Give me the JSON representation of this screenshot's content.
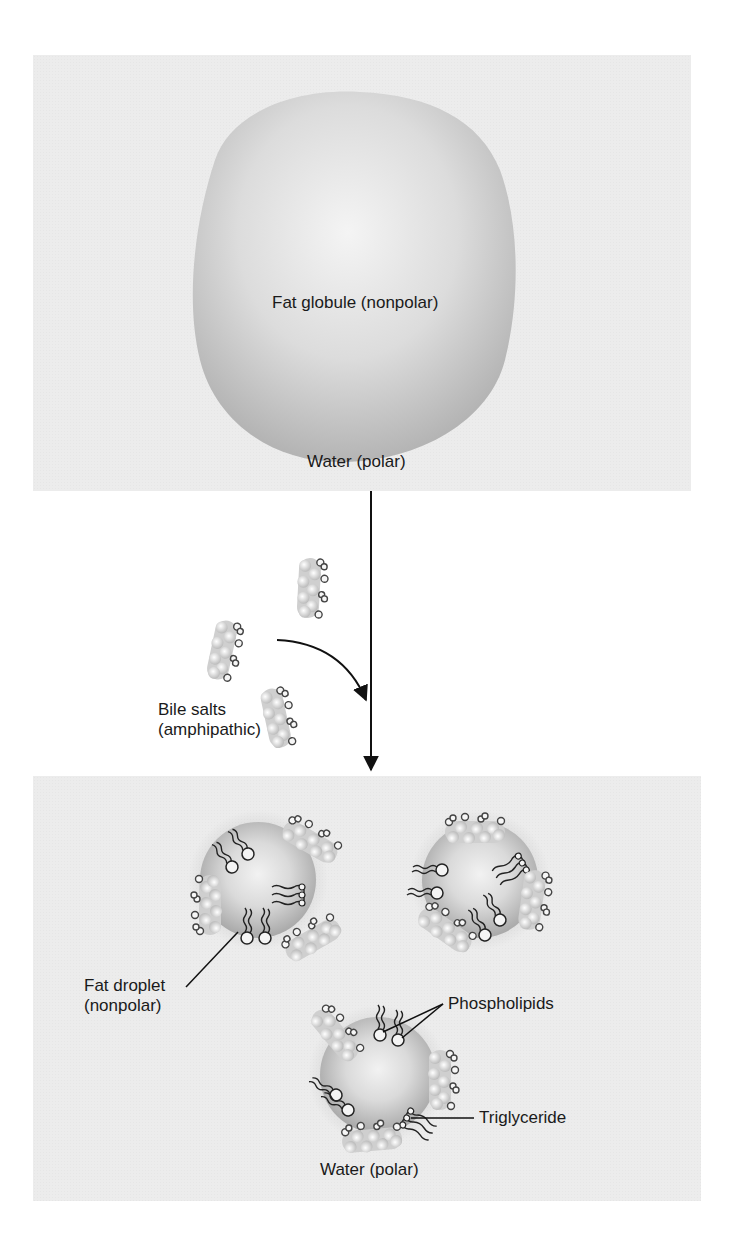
{
  "figure": {
    "top_panel": {
      "globule_label": "Fat globule (nonpolar)",
      "medium_label": "Water (polar)"
    },
    "transition": {
      "bile_salts_label_line1": "Bile salts",
      "bile_salts_label_line2": "(amphipathic)"
    },
    "bottom_panel": {
      "droplet_label_line1": "Fat droplet",
      "droplet_label_line2": "(nonpolar)",
      "phospholipids_label": "Phospholipids",
      "triglyceride_label": "Triglyceride",
      "medium_label": "Water (polar)"
    },
    "colors": {
      "panel_bg": "#ececec",
      "page_bg": "#ffffff",
      "globule_shade": "#b8b8b8",
      "line": "#111111"
    }
  }
}
